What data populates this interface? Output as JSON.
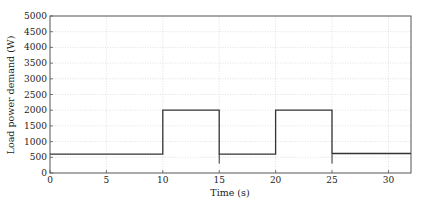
{
  "chart_data": {
    "type": "line",
    "title": "",
    "xlabel": "Time (s)",
    "ylabel": "Load power demand (W)",
    "xlim": [
      0,
      32
    ],
    "ylim": [
      0,
      5000
    ],
    "xticks": [
      0,
      5,
      10,
      15,
      20,
      25,
      30
    ],
    "yticks": [
      0,
      500,
      1000,
      1500,
      2000,
      2500,
      3000,
      3500,
      4000,
      4500,
      5000
    ],
    "grid": true,
    "legend": null,
    "series": [
      {
        "name": "Load power demand",
        "color": "#333333",
        "x": [
          0,
          10,
          10,
          15,
          15,
          20,
          20,
          25,
          25,
          32
        ],
        "y": [
          600,
          600,
          2000,
          2000,
          600,
          600,
          2000,
          2000,
          620,
          620
        ]
      }
    ]
  }
}
